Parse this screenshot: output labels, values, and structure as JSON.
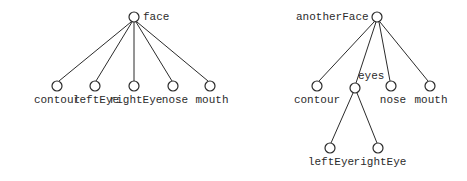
{
  "figure": {
    "background_color": "#ffffff",
    "stroke_color": "#2b2b2b",
    "text_color": "#2b2b2b",
    "node_fill": "#ffffff",
    "width": 467,
    "height": 181
  },
  "trees": [
    {
      "id": "left-tree",
      "root": {
        "label": "face",
        "x": 134,
        "y": 17,
        "r": 5,
        "label_pos": "right"
      },
      "nodes": [
        {
          "label": "contour",
          "x": 57,
          "y": 86,
          "r": 5,
          "label_pos": "below"
        },
        {
          "label": "leftEye",
          "x": 95,
          "y": 86,
          "r": 5,
          "label_pos": "below"
        },
        {
          "label": "rightEye",
          "x": 134,
          "y": 86,
          "r": 5,
          "label_pos": "below"
        },
        {
          "label": "nose",
          "x": 173,
          "y": 86,
          "r": 5,
          "label_pos": "below"
        },
        {
          "label": "mouth",
          "x": 210,
          "y": 86,
          "r": 5,
          "label_pos": "below"
        }
      ],
      "edges": [
        {
          "from": "face",
          "to": "contour"
        },
        {
          "from": "face",
          "to": "leftEye"
        },
        {
          "from": "face",
          "to": "rightEye"
        },
        {
          "from": "face",
          "to": "nose"
        },
        {
          "from": "face",
          "to": "mouth"
        }
      ]
    },
    {
      "id": "right-tree",
      "root": {
        "label": "anotherFace",
        "x": 377,
        "y": 17,
        "r": 5,
        "label_pos": "left"
      },
      "nodes": [
        {
          "label": "contour",
          "x": 317,
          "y": 86,
          "r": 5,
          "label_pos": "below"
        },
        {
          "label": "eyes",
          "x": 355,
          "y": 88,
          "r": 5,
          "label_pos": "right-up"
        },
        {
          "label": "nose",
          "x": 391,
          "y": 86,
          "r": 5,
          "label_pos": "below"
        },
        {
          "label": "mouth",
          "x": 430,
          "y": 86,
          "r": 5,
          "label_pos": "below"
        },
        {
          "label": "leftEye",
          "x": 330,
          "y": 148,
          "r": 5,
          "label_pos": "below"
        },
        {
          "label": "rightEye",
          "x": 378,
          "y": 148,
          "r": 5,
          "label_pos": "below"
        }
      ],
      "edges": [
        {
          "from": "anotherFace",
          "to": "contour"
        },
        {
          "from": "anotherFace",
          "to": "eyes"
        },
        {
          "from": "anotherFace",
          "to": "nose"
        },
        {
          "from": "anotherFace",
          "to": "mouth"
        },
        {
          "from": "eyes",
          "to": "leftEye"
        },
        {
          "from": "eyes",
          "to": "rightEye"
        }
      ]
    }
  ],
  "labels": {
    "left_root": "face",
    "left_contour": "contour",
    "left_leftEye": "leftEye",
    "left_rightEye": "rightEye",
    "left_nose": "nose",
    "left_mouth": "mouth",
    "right_root": "anotherFace",
    "right_contour": "contour",
    "right_eyes": "eyes",
    "right_nose": "nose",
    "right_mouth": "mouth",
    "right_leftEye": "leftEye",
    "right_rightEye": "rightEye"
  }
}
